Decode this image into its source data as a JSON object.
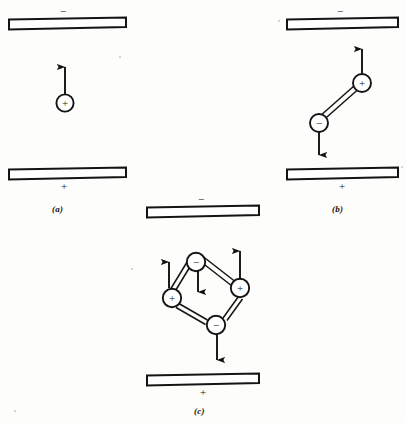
{
  "figure": {
    "background_color": "#fdfdfb",
    "ink_color": "#111111",
    "panel_count": 3
  },
  "panels": [
    {
      "id": "a",
      "caption": "(a)",
      "description": "single positive point charge between plates",
      "top_plate": {
        "label": "−",
        "label_name": "minus-sign",
        "polarity": "negative"
      },
      "bottom_plate": {
        "label": "+",
        "label_name": "plus-sign",
        "polarity": "positive"
      },
      "charges": [
        {
          "sign": "+",
          "name": "positive-charge",
          "force_arrow": "up"
        }
      ],
      "rods": 0,
      "arrows": [
        {
          "direction": "up",
          "name": "force-arrow-up"
        }
      ]
    },
    {
      "id": "b",
      "caption": "(b)",
      "description": "electric dipole: positive charge upper right, negative charge lower left, joined by a rigid rod",
      "top_plate": {
        "label": "−",
        "label_name": "minus-sign",
        "polarity": "negative"
      },
      "bottom_plate": {
        "label": "+",
        "label_name": "plus-sign",
        "polarity": "positive"
      },
      "charges": [
        {
          "sign": "+",
          "name": "positive-charge",
          "force_arrow": "up"
        },
        {
          "sign": "−",
          "name": "negative-charge",
          "force_arrow": "down"
        }
      ],
      "rods": 1,
      "arrows": [
        {
          "direction": "up",
          "name": "force-arrow-up"
        },
        {
          "direction": "down",
          "name": "force-arrow-down"
        }
      ]
    },
    {
      "id": "c",
      "caption": "(c)",
      "description": "quadrupole: four charges at the corners of a rhombus joined by rigid rods",
      "top_plate": {
        "label": "−",
        "label_name": "minus-sign",
        "polarity": "negative"
      },
      "bottom_plate": {
        "label": "+",
        "label_name": "plus-sign",
        "polarity": "positive"
      },
      "charges": [
        {
          "sign": "−",
          "name": "negative-charge-top",
          "force_arrow": "down"
        },
        {
          "sign": "+",
          "name": "positive-charge-left",
          "force_arrow": "up"
        },
        {
          "sign": "+",
          "name": "positive-charge-right",
          "force_arrow": "up"
        },
        {
          "sign": "−",
          "name": "negative-charge-bottom",
          "force_arrow": "down"
        }
      ],
      "rods": 4,
      "arrows": [
        {
          "direction": "down",
          "name": "force-arrow-down"
        },
        {
          "direction": "up",
          "name": "force-arrow-up"
        },
        {
          "direction": "up",
          "name": "force-arrow-up"
        },
        {
          "direction": "down",
          "name": "force-arrow-down"
        }
      ]
    }
  ],
  "glyphs": {
    "plus": "+",
    "minus": "−"
  }
}
